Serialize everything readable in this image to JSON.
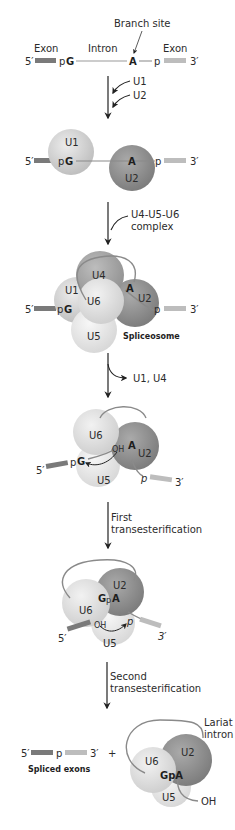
{
  "colors": {
    "exon5": "#7a7a7a",
    "exon3": "#bdbdbd",
    "intron": "#9a9a9a",
    "u1": "#cfcfcf",
    "u2": "#8e8e8e",
    "u4": "#a3a3a3",
    "u5": "#e4e4e4",
    "u6": "#dadada",
    "arrow": "#222222"
  },
  "stage1": {
    "branch_site": "Branch site",
    "exon_left": "Exon",
    "intron": "Intron",
    "exon_right": "Exon",
    "five_prime": "5′",
    "three_prime": "3′",
    "pG_p": "p",
    "pG_G": "G",
    "A": "A",
    "p": "p"
  },
  "step1": {
    "u1": "U1",
    "u2": "U2"
  },
  "stage2": {
    "five_prime": "5′",
    "three_prime": "3′",
    "u1": "U1",
    "u2": "U2",
    "pG_p": "p",
    "pG_G": "G",
    "A": "A",
    "p": "p"
  },
  "step2": {
    "line1": "U4-U5-U6",
    "line2": "complex"
  },
  "stage3": {
    "five_prime": "5′",
    "three_prime": "3′",
    "u1": "U1",
    "u2": "U2",
    "u4": "U4",
    "u5": "U5",
    "u6": "U6",
    "pG_p": "p",
    "pG_G": "G",
    "A": "A",
    "p": "p",
    "caption": "Spliceosome"
  },
  "step3": {
    "label": "U1, U4"
  },
  "stage4": {
    "five_prime": "5′",
    "three_prime": "3′",
    "u6": "U6",
    "u2": "U2",
    "u5": "U5",
    "oh": "OH",
    "A": "A",
    "pG_p": "p",
    "pG_G": "G",
    "p": "p"
  },
  "step4": {
    "line1": "First",
    "line2": "transesterification"
  },
  "stage5": {
    "five_prime": "5′",
    "three_prime": "3′",
    "u6": "U6",
    "u2": "U2",
    "u5": "U5",
    "G": "G",
    "p_mid": "p",
    "A": "A",
    "oh": "OH",
    "p": "p"
  },
  "step5": {
    "line1": "Second",
    "line2": "transesterification"
  },
  "stage6": {
    "five_prime": "5′",
    "p": "p",
    "three_prime": "3′",
    "plus": "+",
    "spliced_caption": "Spliced exons",
    "lariat_line1": "Lariat",
    "lariat_line2": "intron",
    "u6": "U6",
    "u2": "U2",
    "u5": "U5",
    "GpA": "GpA",
    "oh": "OH"
  }
}
